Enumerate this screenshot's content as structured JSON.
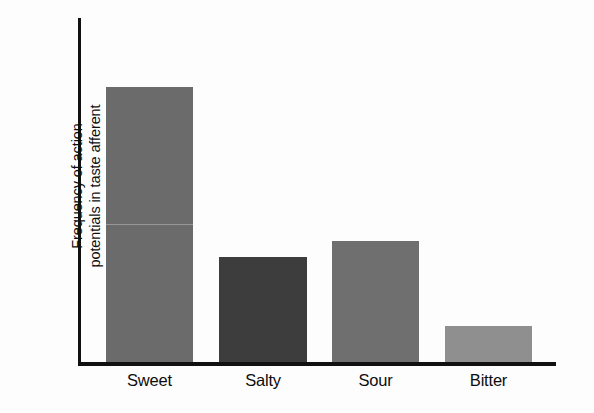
{
  "chart_data": {
    "type": "bar",
    "title": "",
    "xlabel": "",
    "ylabel": "Frequency of action potentials in taste afferent",
    "ylabel_lines": [
      "Frequency of action",
      "potentials in taste afferent"
    ],
    "categories": [
      "Sweet",
      "Salty",
      "Sour",
      "Bitter"
    ],
    "values": [
      100,
      38,
      44,
      13
    ],
    "ylim": [
      0,
      100
    ],
    "y_axis_ticks": [],
    "grid": false,
    "legend": null,
    "bar_colors": [
      "#6b6b6b",
      "#3d3d3d",
      "#6f6f6f",
      "#8f8f8f"
    ],
    "axis_color": "#111111",
    "background_color": "#fdfdfd"
  },
  "axes": {
    "y_axis_name": "y-axis-line",
    "x_axis_name": "x-axis-line"
  }
}
